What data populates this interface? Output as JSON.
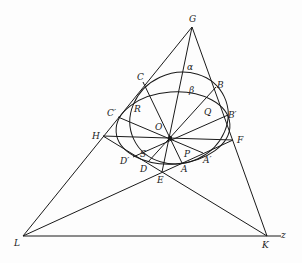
{
  "diagram": {
    "type": "projective-geometry-figure",
    "stroke_color": "#1a1a1a",
    "background": "#fdfdfd",
    "points": {
      "G": {
        "label": "G",
        "x": 192,
        "y": 27,
        "lx": 189,
        "ly": 22
      },
      "L": {
        "label": "L",
        "x": 23,
        "y": 236,
        "lx": 14,
        "ly": 246
      },
      "K": {
        "label": "K",
        "x": 267,
        "y": 236,
        "lx": 262,
        "ly": 248
      },
      "H": {
        "label": "H",
        "x": 103,
        "y": 136,
        "lx": 92,
        "ly": 139
      },
      "F": {
        "label": "F",
        "x": 233,
        "y": 140,
        "lx": 237,
        "ly": 143
      },
      "E": {
        "label": "E",
        "x": 162,
        "y": 172,
        "lx": 157,
        "ly": 183
      },
      "O": {
        "label": "O",
        "x": 170,
        "y": 138,
        "lx": 155,
        "ly": 130
      },
      "C": {
        "label": "C",
        "x": 143,
        "y": 82,
        "lx": 137,
        "ly": 80
      },
      "B": {
        "label": "B",
        "x": 216,
        "y": 87,
        "lx": 217,
        "ly": 88
      },
      "Cp": {
        "label": "C′",
        "x": 118,
        "y": 117,
        "lx": 107,
        "ly": 116
      },
      "Bp": {
        "label": "B′",
        "x": 228,
        "y": 115,
        "lx": 228,
        "ly": 118
      },
      "Dp": {
        "label": "D′",
        "x": 133,
        "y": 157,
        "lx": 120,
        "ly": 164
      },
      "D": {
        "label": "D",
        "x": 148,
        "y": 162,
        "lx": 140,
        "ly": 172
      },
      "A": {
        "label": "A",
        "x": 182,
        "y": 163,
        "lx": 181,
        "ly": 172
      },
      "Ap": {
        "label": "A′",
        "x": 203,
        "y": 153,
        "lx": 203,
        "ly": 163
      },
      "R": {
        "label": "R",
        "x": 0,
        "y": 0,
        "lx": 134,
        "ly": 112
      },
      "Q": {
        "label": "Q",
        "x": 0,
        "y": 0,
        "lx": 204,
        "ly": 115
      },
      "S": {
        "label": "S",
        "x": 0,
        "y": 0,
        "lx": 140,
        "ly": 157
      },
      "P": {
        "label": "P",
        "x": 0,
        "y": 0,
        "lx": 184,
        "ly": 157
      },
      "alpha": {
        "label": "α",
        "x": 0,
        "y": 0,
        "lx": 187,
        "ly": 70
      },
      "beta": {
        "label": "β",
        "x": 0,
        "y": 0,
        "lx": 189,
        "ly": 93
      },
      "z": {
        "label": "z",
        "x": 0,
        "y": 0,
        "lx": 281,
        "ly": 238
      }
    }
  }
}
